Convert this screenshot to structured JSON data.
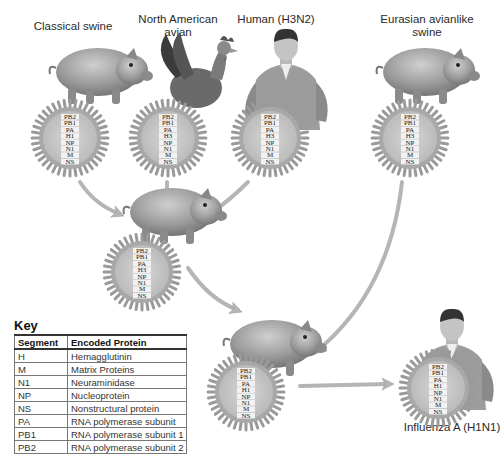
{
  "sources": [
    {
      "id": "classical_swine",
      "label": "Classical swine",
      "host": "pig",
      "segments": [
        "PB2",
        "PB1",
        "PA",
        "H1",
        "NP",
        "N1",
        "M",
        "NS"
      ]
    },
    {
      "id": "north_american_avian",
      "label": "North American avian",
      "label_lines": [
        "North American",
        "avian"
      ],
      "host": "rooster",
      "segments": [
        "PB2",
        "PB1",
        "PA",
        "H3",
        "NP",
        "N1",
        "M",
        "NS"
      ]
    },
    {
      "id": "human_h3n2",
      "label": "Human (H3N2)",
      "host": "human",
      "segments": [
        "PB2",
        "PB1",
        "PA",
        "H3",
        "NP",
        "N1",
        "M",
        "NS"
      ]
    },
    {
      "id": "eurasian_avianlike_swine",
      "label": "Eurasian avianlike swine",
      "label_lines": [
        "Eurasian avianlike",
        "swine"
      ],
      "host": "pig",
      "segments": [
        "PB2",
        "PB1",
        "PA",
        "H3",
        "NP",
        "N1",
        "M",
        "NS"
      ]
    }
  ],
  "intermediate": {
    "id": "triple_reassortant_swine",
    "host": "pig",
    "segments": [
      "PB2",
      "PB1",
      "PA",
      "H3",
      "NP",
      "N1",
      "M",
      "NS"
    ]
  },
  "reassortant": {
    "id": "reassortant_swine",
    "host": "pig",
    "segments": [
      "PB2",
      "PB1",
      "PA",
      "H1",
      "NP",
      "N1",
      "M",
      "NS"
    ]
  },
  "result": {
    "id": "influenza_a_h1n1",
    "label": "Influenza A (H1N1)",
    "host": "human",
    "segments": [
      "PB2",
      "PB1",
      "PA",
      "H1",
      "NP",
      "N1",
      "M",
      "NS"
    ]
  },
  "key": {
    "title": "Key",
    "headers": {
      "segment": "Segment",
      "protein": "Encoded Protein"
    },
    "rows": [
      {
        "segment": "H",
        "protein": "Hemagglutinin"
      },
      {
        "segment": "M",
        "protein": "Matrix Proteins"
      },
      {
        "segment": "N1",
        "protein": "Neuraminidase"
      },
      {
        "segment": "NP",
        "protein": "Nucleoprotein"
      },
      {
        "segment": "NS",
        "protein": "Nonstructural protein"
      },
      {
        "segment": "PA",
        "protein": "RNA polymerase subunit"
      },
      {
        "segment": "PB1",
        "protein": "RNA polymerase subunit 1"
      },
      {
        "segment": "PB2",
        "protein": "RNA polymerase subunit 2"
      }
    ]
  },
  "colors": {
    "virus_fill": "#c9c9c9",
    "spike": "#9a9a9a",
    "arrow": "#b5b5b5",
    "host": "#8f8f8f"
  }
}
